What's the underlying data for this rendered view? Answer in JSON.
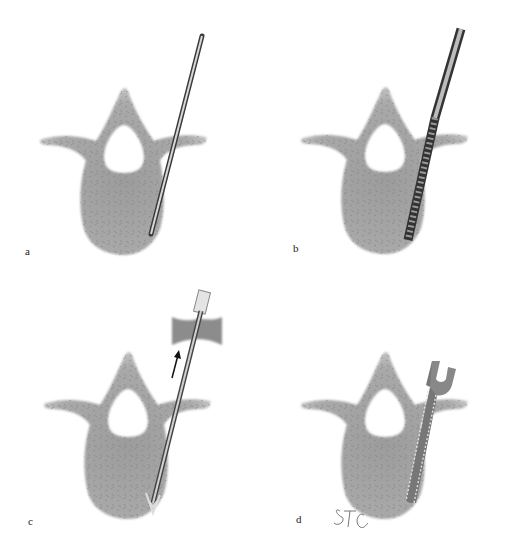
{
  "figure": {
    "panels": [
      {
        "id": "a",
        "label": "a",
        "instrument": "guide-pin"
      },
      {
        "id": "b",
        "label": "b",
        "instrument": "cannulated-drill"
      },
      {
        "id": "c",
        "label": "c",
        "instrument": "sleeve-with-barbed-tip",
        "arrow": "withdrawal"
      },
      {
        "id": "d",
        "label": "d",
        "instrument": "forked-implant"
      }
    ],
    "signature": "STC",
    "colors": {
      "bone": "#a8a8a8",
      "bone_dark": "#8a8a8a",
      "bone_edge": "#cfcfcf",
      "metal_light": "#e6e6e6",
      "metal_dark": "#3a3a3a",
      "background": "#ffffff"
    }
  }
}
